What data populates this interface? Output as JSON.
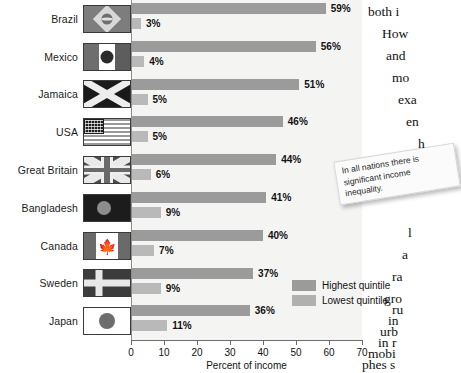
{
  "chart_data": {
    "type": "bar",
    "orientation": "horizontal",
    "title": "",
    "xlabel": "Percent of income",
    "ylabel": "",
    "xlim": [
      0,
      70
    ],
    "xticks": [
      0,
      10,
      20,
      30,
      40,
      50,
      60,
      70
    ],
    "grid": false,
    "legend_position": "inside-bottom-right",
    "categories": [
      "Brazil",
      "Mexico",
      "Jamaica",
      "USA",
      "Great Britain",
      "Bangladesh",
      "Canada",
      "Sweden",
      "Japan"
    ],
    "series": [
      {
        "name": "Highest quintile",
        "color": "#9b9b9b",
        "values": [
          59,
          56,
          51,
          46,
          44,
          41,
          40,
          37,
          36
        ],
        "labels": [
          "59%",
          "56%",
          "51%",
          "46%",
          "44%",
          "41%",
          "40%",
          "37%",
          "36%"
        ]
      },
      {
        "name": "Lowest quintile",
        "color": "#b9b9b9",
        "values": [
          3,
          4,
          5,
          5,
          6,
          9,
          7,
          9,
          11
        ],
        "labels": [
          "3%",
          "4%",
          "5%",
          "5%",
          "6%",
          "9%",
          "7%",
          "9%",
          "11%"
        ]
      }
    ],
    "flags": [
      "brazil",
      "mexico",
      "jamaica",
      "usa",
      "great-britain",
      "bangladesh",
      "canada",
      "sweden",
      "japan"
    ]
  },
  "callout": {
    "line1": "In all nations there is",
    "line2": "significant income",
    "line3": "inequality."
  },
  "body_text": {
    "lines": [
      "both i",
      "How",
      "and",
      "mo",
      "exa",
      "en",
      "h",
      "l",
      "a",
      "ra",
      "gro",
      "ru",
      "in",
      "urb",
      "in r",
      "mobi",
      "phes s"
    ]
  }
}
